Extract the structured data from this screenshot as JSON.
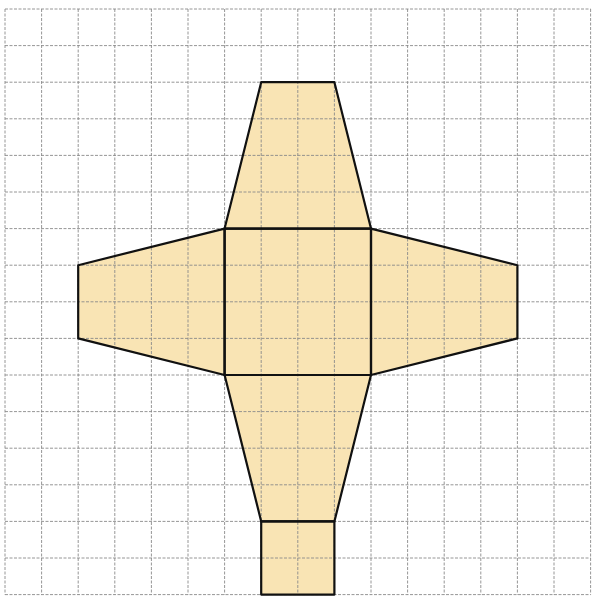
{
  "diagram": {
    "type": "net-of-square-frustum-on-grid",
    "grid": {
      "origin_px": [
        5,
        9
      ],
      "cell_px": 36.6,
      "cols": 16,
      "rows": 16,
      "line_color": "#8a8a8a",
      "line_style": "dashed"
    },
    "style": {
      "fill": "#f9e4b4",
      "stroke": "#111111",
      "stroke_width": 2.2
    },
    "shapes": [
      {
        "name": "center-square",
        "points": [
          [
            6,
            6
          ],
          [
            10,
            6
          ],
          [
            10,
            10
          ],
          [
            6,
            10
          ]
        ]
      },
      {
        "name": "top-trapezoid",
        "points": [
          [
            7,
            2
          ],
          [
            9,
            2
          ],
          [
            10,
            6
          ],
          [
            6,
            6
          ]
        ]
      },
      {
        "name": "left-trapezoid",
        "points": [
          [
            2,
            7
          ],
          [
            6,
            6
          ],
          [
            6,
            10
          ],
          [
            2,
            9
          ]
        ]
      },
      {
        "name": "right-trapezoid",
        "points": [
          [
            10,
            6
          ],
          [
            14,
            7
          ],
          [
            14,
            9
          ],
          [
            10,
            10
          ]
        ]
      },
      {
        "name": "bottom-trapezoid",
        "points": [
          [
            6,
            10
          ],
          [
            10,
            10
          ],
          [
            9,
            14
          ],
          [
            7,
            14
          ]
        ]
      },
      {
        "name": "bottom-square",
        "points": [
          [
            7,
            14
          ],
          [
            9,
            14
          ],
          [
            9,
            16
          ],
          [
            7,
            16
          ]
        ]
      }
    ]
  }
}
